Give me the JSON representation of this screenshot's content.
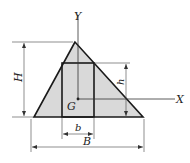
{
  "diagram": {
    "labels": {
      "y_axis": "Y",
      "x_axis": "X",
      "centroid": "G",
      "total_height": "H",
      "rect_height": "h",
      "rect_width": "b",
      "total_base": "B"
    },
    "colors": {
      "fill": "#d9d9d9",
      "stroke": "#1a1a1a",
      "dim_line": "#444444"
    }
  }
}
